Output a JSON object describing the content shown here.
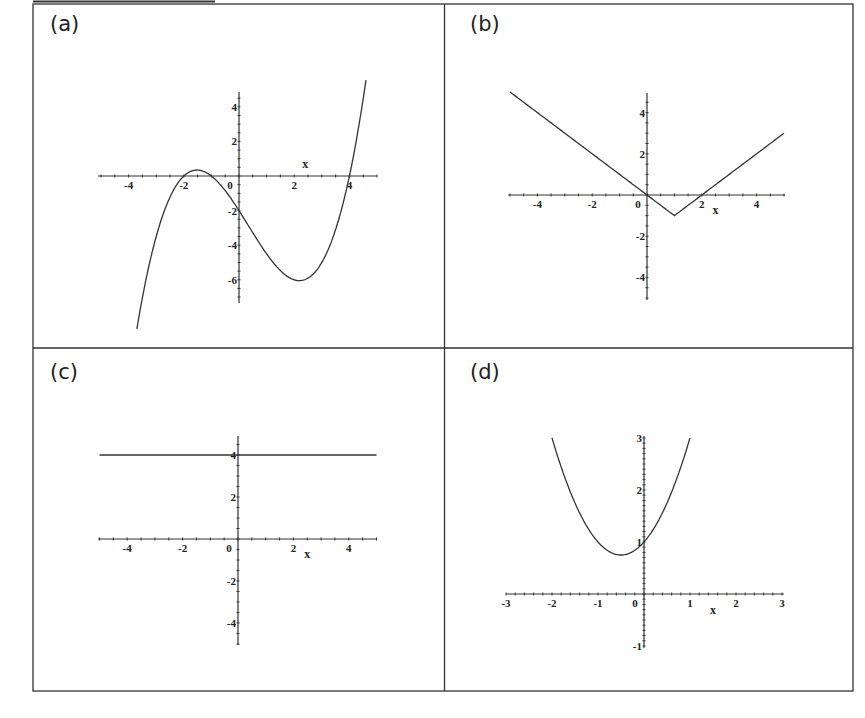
{
  "panels_labels": [
    "(a)",
    "(b)",
    "(c)",
    "(d)"
  ],
  "chart_data": [
    {
      "id": "a",
      "label": "(a)",
      "type": "line",
      "function": "0.25*(x+2)*(x+1)*(x-4)",
      "xlabel": "x",
      "x_range": [
        -3.7,
        4.6
      ],
      "xlim": [
        -5,
        5
      ],
      "ylim": [
        -7,
        5
      ],
      "xticks": [
        -4,
        -2,
        0,
        2,
        4
      ],
      "yticks": [
        -6,
        -4,
        -2,
        2,
        4
      ],
      "key_points": [
        [
          -2,
          0
        ],
        [
          -1,
          0
        ],
        [
          0,
          -2
        ],
        [
          4,
          0
        ],
        [
          2.3,
          -6.0
        ]
      ],
      "frame": {
        "left": 34,
        "top": 4,
        "width": 411,
        "height": 344
      },
      "origin_px": [
        239,
        176
      ],
      "unit_px": [
        27.6,
        17.3
      ],
      "axis_px": {
        "x": [
          98,
          377
        ],
        "y": [
          92,
          303
        ]
      }
    },
    {
      "id": "b",
      "label": "(b)",
      "type": "line",
      "function": "abs(x-1)-1",
      "xlabel": "x",
      "x_range": [
        -5,
        5
      ],
      "xlim": [
        -5,
        5
      ],
      "ylim": [
        -5,
        5
      ],
      "xticks": [
        -4,
        -2,
        0,
        2,
        4
      ],
      "yticks": [
        -4,
        -2,
        2,
        4
      ],
      "key_points": [
        [
          -5,
          5
        ],
        [
          0,
          0
        ],
        [
          1,
          -1
        ],
        [
          2,
          0
        ],
        [
          5,
          3
        ]
      ],
      "frame": {
        "left": 445,
        "top": 4,
        "width": 408,
        "height": 344
      },
      "origin_px": [
        647,
        195
      ],
      "unit_px": [
        27.4,
        20.6
      ],
      "axis_px": {
        "x": [
          508,
          785
        ],
        "y": [
          93,
          300
        ]
      }
    },
    {
      "id": "c",
      "label": "(c)",
      "type": "line",
      "function": "4",
      "xlabel": "x",
      "x_range": [
        -5,
        5
      ],
      "xlim": [
        -5,
        5
      ],
      "ylim": [
        -5,
        5
      ],
      "xticks": [
        -4,
        -2,
        0,
        2,
        4
      ],
      "yticks": [
        -4,
        -2,
        2,
        4
      ],
      "key_points": [
        [
          -5,
          4
        ],
        [
          5,
          4
        ]
      ],
      "frame": {
        "left": 34,
        "top": 348,
        "width": 411,
        "height": 343
      },
      "origin_px": [
        238,
        539
      ],
      "unit_px": [
        27.7,
        21.0
      ],
      "axis_px": {
        "x": [
          98,
          377
        ],
        "y": [
          436,
          645
        ]
      }
    },
    {
      "id": "d",
      "label": "(d)",
      "type": "line",
      "function": "x^2+x+1",
      "xlabel": "x",
      "x_range": [
        -2,
        1
      ],
      "xlim": [
        -3,
        3
      ],
      "ylim": [
        -1,
        3
      ],
      "xticks": [
        -3,
        -2,
        -1,
        0,
        1,
        2,
        3
      ],
      "yticks": [
        -1,
        1,
        2,
        3
      ],
      "key_points": [
        [
          -2,
          3
        ],
        [
          -0.5,
          0.75
        ],
        [
          0,
          1
        ],
        [
          1,
          3
        ]
      ],
      "frame": {
        "left": 445,
        "top": 348,
        "width": 408,
        "height": 343
      },
      "origin_px": [
        644,
        594
      ],
      "unit_px": [
        46.0,
        52.0
      ],
      "axis_px": {
        "x": [
          506,
          784
        ],
        "y": [
          436,
          648
        ]
      }
    }
  ]
}
